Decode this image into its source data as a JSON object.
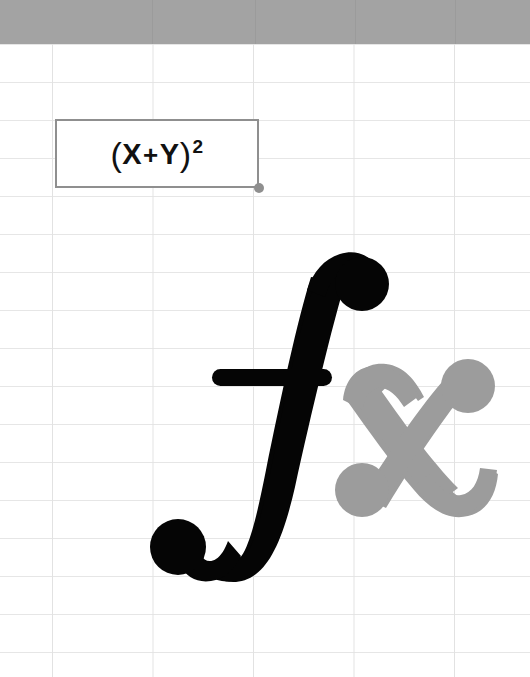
{
  "canvas": {
    "width": 530,
    "height": 677,
    "background": "#ffffff"
  },
  "grid": {
    "name": "spreadsheet-grid",
    "line_color": "#e3e3e3",
    "column_width": 100,
    "row_height": 38,
    "first_vertical_line_x": 52,
    "first_horizontal_line_y": 44
  },
  "header_band": {
    "name": "column-header-band",
    "color": "#a3a3a3",
    "height": 44,
    "separator_color": "#9b9b9b",
    "separator_positions": [
      152,
      255,
      355,
      455
    ]
  },
  "selected_cell": {
    "name": "selected-cell",
    "border_color": "#8f8f8f",
    "fill_color": "#ffffff",
    "x": 55,
    "y": 119,
    "width": 204,
    "height": 69,
    "formula": {
      "full_text": "(X + Y)²",
      "open_paren": "(",
      "operand_left": "X",
      "operator": "+",
      "operand_right": "Y",
      "close_paren": ")",
      "exponent": "2",
      "text_color": "#111111"
    },
    "fill_handle": {
      "name": "fill-handle",
      "color": "#8f8f8f",
      "x": 259,
      "y": 188,
      "radius": 5
    }
  },
  "logo": {
    "name": "fx-logo",
    "text": "fx",
    "glyphs": [
      {
        "name": "f-glyph",
        "character": "f",
        "color": "#050505",
        "style": "italic-serif-ball-terminal",
        "bounds": {
          "x": 150,
          "y": 253,
          "width": 232,
          "height": 330
        }
      },
      {
        "name": "x-glyph",
        "character": "x",
        "color": "#9c9c9c",
        "style": "italic-serif-ball-terminal",
        "bounds": {
          "x": 343,
          "y": 364,
          "width": 155,
          "height": 152
        }
      }
    ]
  }
}
